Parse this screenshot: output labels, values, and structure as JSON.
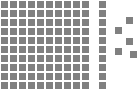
{
  "figure": {
    "title": "",
    "background_color": "#ffffff",
    "width": 139,
    "height": 91
  },
  "chart_data": {
    "type": "waffle",
    "title": "",
    "subtitle": "",
    "xlabel": "",
    "ylabel": "",
    "legend_position": "none",
    "grid": false,
    "unit_color": "#808080",
    "unit_size": 7,
    "cell_pitch": 9,
    "groups": [
      {
        "name": "main-block",
        "label": "Main block",
        "layout": "grid",
        "columns": 10,
        "rows": 10,
        "count": 100,
        "origin_x": 1,
        "origin_y": 1,
        "color": "#808080"
      },
      {
        "name": "detached-column",
        "label": "Detached column",
        "layout": "grid",
        "columns": 1,
        "rows": 10,
        "count": 10,
        "origin_x": 99,
        "origin_y": 1,
        "color": "#808080"
      },
      {
        "name": "scattered-units",
        "label": "Scattered units",
        "layout": "free",
        "count": 5,
        "color": "#808080",
        "positions": [
          {
            "x": 126,
            "y": 17
          },
          {
            "x": 115,
            "y": 27
          },
          {
            "x": 126,
            "y": 38
          },
          {
            "x": 115,
            "y": 48
          },
          {
            "x": 130,
            "y": 51
          }
        ]
      }
    ],
    "totals": {
      "main_block": 100,
      "detached_column": 10,
      "scattered": 5,
      "all_units": 115
    }
  }
}
